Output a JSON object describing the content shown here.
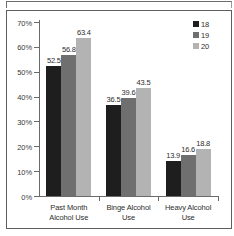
{
  "chart_data": {
    "type": "bar",
    "title": "",
    "subtitle": "",
    "xlabel": "",
    "ylabel": "",
    "ylim": [
      0,
      70
    ],
    "ytick_labels": [
      "0%",
      "10%",
      "20%",
      "30%",
      "40%",
      "50%",
      "60%",
      "70%"
    ],
    "ytick_values": [
      0,
      10,
      20,
      30,
      40,
      50,
      60,
      70
    ],
    "grid": false,
    "legend_position": "top-right",
    "categories": [
      "Past Month Alcohol Use",
      "Binge Alcohol Use",
      "Heavy Alcohol Use"
    ],
    "category_lines": [
      [
        "Past Month",
        "Alcohol Use"
      ],
      [
        "Binge Alcohol",
        "Use"
      ],
      [
        "Heavy Alcohol",
        "Use"
      ]
    ],
    "series": [
      {
        "name": "18",
        "color": "#1e1e1e",
        "values": [
          52.5,
          56.8,
          63.4
        ]
      },
      {
        "name": "19",
        "color": "#6f6f6f",
        "values": [
          36.5,
          39.6,
          43.5
        ]
      },
      {
        "name": "20",
        "color": "#b3b3b3",
        "values": [
          13.9,
          16.6,
          18.8
        ]
      }
    ],
    "grouped_values": [
      {
        "category": "Past Month Alcohol Use",
        "values": [
          52.5,
          56.8,
          63.4
        ],
        "labels": [
          "52.5",
          "56.8",
          "63.4"
        ]
      },
      {
        "category": "Binge Alcohol Use",
        "values": [
          36.5,
          39.6,
          43.5
        ],
        "labels": [
          "36.5",
          "39.6",
          "43.5"
        ]
      },
      {
        "category": "Heavy Alcohol Use",
        "values": [
          13.9,
          16.6,
          18.8
        ],
        "labels": [
          "13.9",
          "16.6",
          "18.8"
        ]
      }
    ],
    "legend": [
      {
        "label": "18",
        "color": "#1e1e1e"
      },
      {
        "label": "19",
        "color": "#6f6f6f"
      },
      {
        "label": "20",
        "color": "#b3b3b3"
      }
    ]
  }
}
